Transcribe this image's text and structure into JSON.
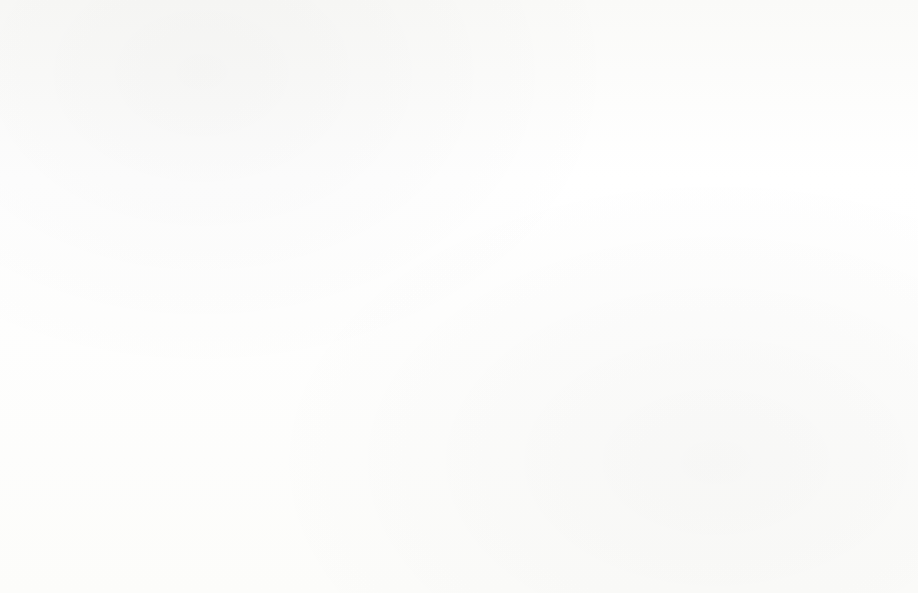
{
  "chart_data": {
    "type": "bar",
    "title": "",
    "xlabel": "",
    "ylabel": "Percentage",
    "ylim": [
      0,
      14
    ],
    "ytick_labels": [
      "14%",
      "12%",
      "10%",
      "8%",
      "6%",
      "4%",
      "2%",
      "0%"
    ],
    "ytick_values": [
      14,
      12,
      10,
      8,
      6,
      4,
      2,
      0
    ],
    "grid": true,
    "legend_position": "bottom",
    "categories": [
      "7:00",
      "8:00",
      "9:00",
      "10:00",
      "11:00",
      "12:00",
      "13:00",
      "14:00",
      "15:00",
      "16:00",
      "17:00",
      "18:00",
      "19:00",
      "20:00",
      "21:00"
    ],
    "series": [
      {
        "name": "Business travel percentage",
        "color": "#8b8b8b",
        "values": [
          3.8,
          4.85,
          7.7,
          8.3,
          8.6,
          9.2,
          7.8,
          7.2,
          6.1,
          6.25,
          4.4,
          5.35,
          6.65,
          7.55,
          4.7
        ]
      },
      {
        "name": "External travel percentage",
        "color": "#3b3b3b",
        "values": [
          0.0,
          2.45,
          9.0,
          12.15,
          12.55,
          11.4,
          11.65,
          11.05,
          10.5,
          7.7,
          2.4,
          2.5,
          2.4,
          1.7,
          0.85
        ]
      }
    ]
  },
  "legend": {
    "items": [
      {
        "label": "Business travel percentage",
        "swatch": "legend-swatch-business"
      },
      {
        "label": "External travel percentage",
        "swatch": "legend-swatch-external"
      }
    ]
  },
  "axis": {
    "y_title": "Percentage"
  }
}
